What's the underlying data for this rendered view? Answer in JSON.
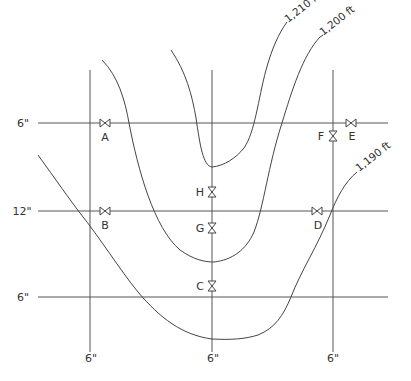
{
  "diagram": {
    "type": "piping network over elevation contours",
    "horizontal_pipes": [
      {
        "id": "top",
        "size_label": "6\"",
        "y": 123
      },
      {
        "id": "middle",
        "size_label": "12\"",
        "y": 211
      },
      {
        "id": "bottom",
        "size_label": "6\"",
        "y": 297
      }
    ],
    "vertical_pipes": [
      {
        "id": "left",
        "size_label": "6\"",
        "x": 90
      },
      {
        "id": "center",
        "size_label": "6\"",
        "x": 212
      },
      {
        "id": "right",
        "size_label": "6\"",
        "x": 333
      }
    ],
    "valves": [
      {
        "label": "A",
        "pipe": "top",
        "orientation": "horizontal"
      },
      {
        "label": "B",
        "pipe": "middle",
        "orientation": "horizontal"
      },
      {
        "label": "C",
        "pipe": "center",
        "orientation": "vertical"
      },
      {
        "label": "D",
        "pipe": "middle",
        "orientation": "horizontal"
      },
      {
        "label": "E",
        "pipe": "top",
        "orientation": "horizontal"
      },
      {
        "label": "F",
        "pipe": "right",
        "orientation": "vertical"
      },
      {
        "label": "G",
        "pipe": "center",
        "orientation": "vertical"
      },
      {
        "label": "H",
        "pipe": "center",
        "orientation": "vertical"
      }
    ],
    "contours": [
      {
        "label": "1,210 ft"
      },
      {
        "label": "1,200 ft"
      },
      {
        "label": "1,190 ft"
      }
    ]
  }
}
